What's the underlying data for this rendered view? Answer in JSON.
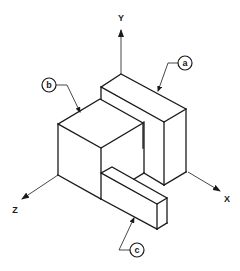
{
  "diagram": {
    "type": "isometric-drawing",
    "axes": {
      "y_label": "Y",
      "x_label": "X",
      "z_label": "Z"
    },
    "callouts": {
      "a": "a",
      "b": "b",
      "c": "c"
    },
    "parts": [
      {
        "id": "a",
        "description": "tall rectangular block at back"
      },
      {
        "id": "b",
        "description": "cube in front-left"
      },
      {
        "id": "c",
        "description": "low bar in front"
      }
    ],
    "colors": {
      "line": "#1a1a1a",
      "background": "#ffffff"
    }
  }
}
